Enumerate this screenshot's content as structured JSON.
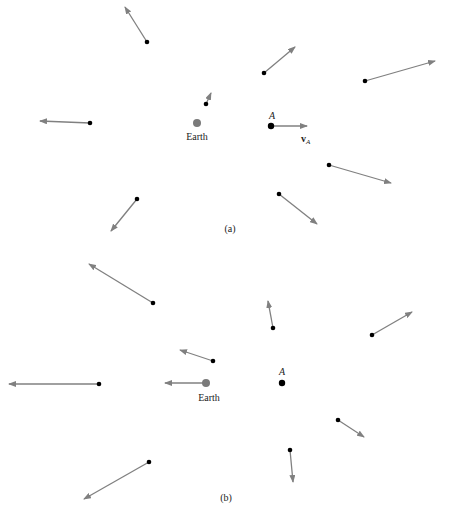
{
  "colors": {
    "arrow": "#808080",
    "point": "#000000",
    "earth": "#7a7a7a",
    "text": "#222222"
  },
  "panels": [
    {
      "id": "a",
      "caption": "(a)",
      "caption_pos": [
        230,
        232
      ],
      "earth": {
        "label": "Earth",
        "x": 197,
        "y": 123,
        "label_x": 197,
        "label_y": 140
      },
      "point_A": {
        "label": "A",
        "x": 271,
        "y": 126,
        "label_x": 272,
        "label_y": 119,
        "velocity_label": "v",
        "velocity_sub": "A",
        "velocity_label_x": 301,
        "velocity_label_y": 142
      },
      "vectors": [
        {
          "x": 271,
          "y": 126,
          "x2": 307,
          "y2": 126
        },
        {
          "x": 147,
          "y": 42,
          "x2": 125,
          "y2": 7
        },
        {
          "x": 264,
          "y": 73,
          "x2": 295,
          "y2": 47
        },
        {
          "x": 365,
          "y": 81,
          "x2": 435,
          "y2": 61
        },
        {
          "x": 206,
          "y": 104,
          "x2": 211,
          "y2": 93
        },
        {
          "x": 90,
          "y": 123,
          "x2": 40,
          "y2": 121
        },
        {
          "x": 137,
          "y": 199,
          "x2": 111,
          "y2": 231
        },
        {
          "x": 329,
          "y": 165,
          "x2": 391,
          "y2": 183
        },
        {
          "x": 279,
          "y": 194,
          "x2": 317,
          "y2": 224
        }
      ]
    },
    {
      "id": "b",
      "caption": "(b)",
      "caption_pos": [
        226,
        501
      ],
      "earth": {
        "label": "Earth",
        "x": 206,
        "y": 383,
        "label_x": 209,
        "label_y": 401
      },
      "point_A": {
        "label": "A",
        "x": 282,
        "y": 383,
        "label_x": 282,
        "label_y": 375
      },
      "vectors": [
        {
          "x": 153,
          "y": 303,
          "x2": 89,
          "y2": 264
        },
        {
          "x": 273,
          "y": 328,
          "x2": 268,
          "y2": 301
        },
        {
          "x": 372,
          "y": 335,
          "x2": 412,
          "y2": 312
        },
        {
          "x": 213,
          "y": 361,
          "x2": 180,
          "y2": 350
        },
        {
          "x": 99,
          "y": 384,
          "x2": 9,
          "y2": 384
        },
        {
          "x": 206,
          "y": 383,
          "x2": 165,
          "y2": 383
        },
        {
          "x": 338,
          "y": 420,
          "x2": 364,
          "y2": 437
        },
        {
          "x": 290,
          "y": 450,
          "x2": 293,
          "y2": 482
        },
        {
          "x": 149,
          "y": 462,
          "x2": 84,
          "y2": 499
        }
      ]
    }
  ]
}
